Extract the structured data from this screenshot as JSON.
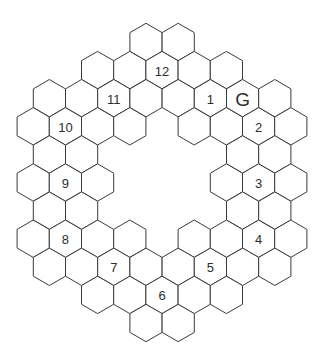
{
  "board": {
    "title": "Hexagonal ring grid",
    "stroke_color": "#3a3a3a",
    "fill_color": "#ffffff",
    "text_color": "#2e2e2e",
    "geometry": {
      "radius": 18.7,
      "col_spacing": 32.2,
      "row_spacing": 28.1,
      "top_y": 42,
      "even_row_origin_x": 146,
      "odd_row_origin_x": 162
    },
    "rows": [
      {
        "row": 0,
        "cols": [
          0,
          1
        ]
      },
      {
        "row": 1,
        "cols": [
          -2,
          -1,
          0,
          1,
          2
        ]
      },
      {
        "row": 2,
        "cols": [
          -3,
          -2,
          -1,
          0,
          1,
          2,
          3,
          4
        ]
      },
      {
        "row": 3,
        "cols": [
          -4,
          -3,
          -2,
          -1,
          1,
          2,
          3,
          4
        ]
      },
      {
        "row": 4,
        "cols": [
          -3,
          -2,
          3,
          4
        ]
      },
      {
        "row": 5,
        "cols": [
          -4,
          -3,
          -2,
          2,
          3,
          4
        ]
      },
      {
        "row": 6,
        "cols": [
          -3,
          -2,
          3,
          4
        ]
      },
      {
        "row": 7,
        "cols": [
          -4,
          -3,
          -2,
          -1,
          1,
          2,
          3,
          4
        ]
      },
      {
        "row": 8,
        "cols": [
          -3,
          -2,
          -1,
          0,
          1,
          2,
          3,
          4
        ]
      },
      {
        "row": 9,
        "cols": [
          -2,
          -1,
          0,
          1,
          2
        ]
      },
      {
        "row": 10,
        "cols": [
          0,
          1
        ]
      }
    ],
    "labels": [
      {
        "text": "12",
        "row": 1,
        "col": 0,
        "kind": "num"
      },
      {
        "text": "11",
        "row": 2,
        "col": -1,
        "kind": "num"
      },
      {
        "text": "1",
        "row": 2,
        "col": 2,
        "kind": "num"
      },
      {
        "text": "G",
        "row": 2,
        "col": 3,
        "kind": "goal"
      },
      {
        "text": "10",
        "row": 3,
        "col": -3,
        "kind": "num"
      },
      {
        "text": "2",
        "row": 3,
        "col": 3,
        "kind": "num"
      },
      {
        "text": "9",
        "row": 5,
        "col": -3,
        "kind": "num"
      },
      {
        "text": "3",
        "row": 5,
        "col": 3,
        "kind": "num"
      },
      {
        "text": "8",
        "row": 7,
        "col": -3,
        "kind": "num"
      },
      {
        "text": "4",
        "row": 7,
        "col": 3,
        "kind": "num"
      },
      {
        "text": "7",
        "row": 8,
        "col": -1,
        "kind": "num"
      },
      {
        "text": "5",
        "row": 8,
        "col": 2,
        "kind": "num"
      },
      {
        "text": "6",
        "row": 9,
        "col": 0,
        "kind": "num"
      }
    ]
  }
}
